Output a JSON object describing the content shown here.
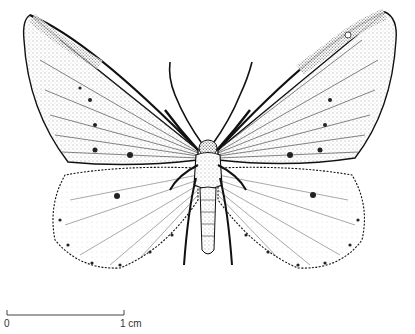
{
  "illustration": {
    "subject": "moth",
    "view": "dorsal, wings spread",
    "colors": {
      "ink": "#1a1a1a",
      "paper": "#ffffff",
      "stipple": "#555555"
    }
  },
  "scale_bar": {
    "start_label": "0",
    "end_label": "1 cm"
  }
}
